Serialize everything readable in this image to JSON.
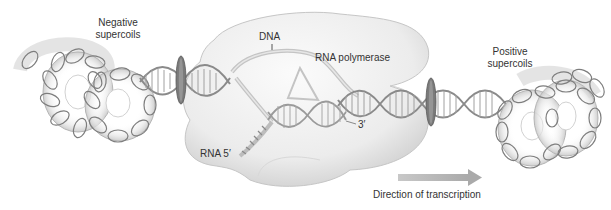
{
  "figure": {
    "labels": {
      "negative_supercoils_line1": "Negative",
      "negative_supercoils_line2": "supercoils",
      "positive_supercoils_line1": "Positive",
      "positive_supercoils_line2": "supercoils",
      "dna": "DNA",
      "rna_polymerase": "RNA polymerase",
      "three_prime": "3′",
      "rna_five_prime": "RNA 5′",
      "direction": "Direction of transcription"
    },
    "colors": {
      "background": "#ffffff",
      "polymerase_fill": "#eeeeee",
      "polymerase_edge": "#c8c8c8",
      "dna_strand": "#8a8a8a",
      "dna_strand_light": "#c4c4c4",
      "rung": "#9a9a9a",
      "topoisomerase": "#6f6f6f",
      "arrow": "#b8b8b8",
      "text": "#333333"
    }
  }
}
